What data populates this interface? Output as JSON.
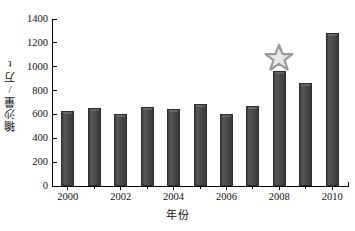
{
  "chart_data": {
    "type": "bar",
    "title": "",
    "xlabel": "年份",
    "ylabel": "输沙量/万t",
    "categories": [
      "2000",
      "2001",
      "2002",
      "2003",
      "2004",
      "2005",
      "2006",
      "2007",
      "2008",
      "2009",
      "2010"
    ],
    "values": [
      632,
      654,
      604,
      665,
      646,
      686,
      604,
      670,
      963,
      864,
      1284
    ],
    "xlim": [
      1999.4,
      2010.6
    ],
    "ylim": [
      0,
      1400
    ],
    "ytick_values": [
      0,
      200,
      400,
      600,
      800,
      1000,
      1200,
      1400
    ],
    "ytick_labels": [
      "0",
      "200",
      "400",
      "600",
      "800",
      "1000",
      "1200",
      "1400"
    ],
    "xtick_values": [
      2000,
      2002,
      2004,
      2006,
      2008,
      2010
    ],
    "xtick_labels": [
      "2000",
      "2002",
      "2004",
      "2006",
      "2008",
      "2010"
    ],
    "xtick_minor_values": [
      2001,
      2003,
      2005,
      2007,
      2009
    ],
    "grid": false,
    "legend": null,
    "bar_color": "#4a4a4a",
    "bar_edge_color": "#2e2e2e",
    "annotations": [
      {
        "name": "star-marker",
        "glyph": "star",
        "category": "2008",
        "value": 1075,
        "color": "#9a9a9a",
        "fill": "#e8e8e8"
      }
    ]
  }
}
